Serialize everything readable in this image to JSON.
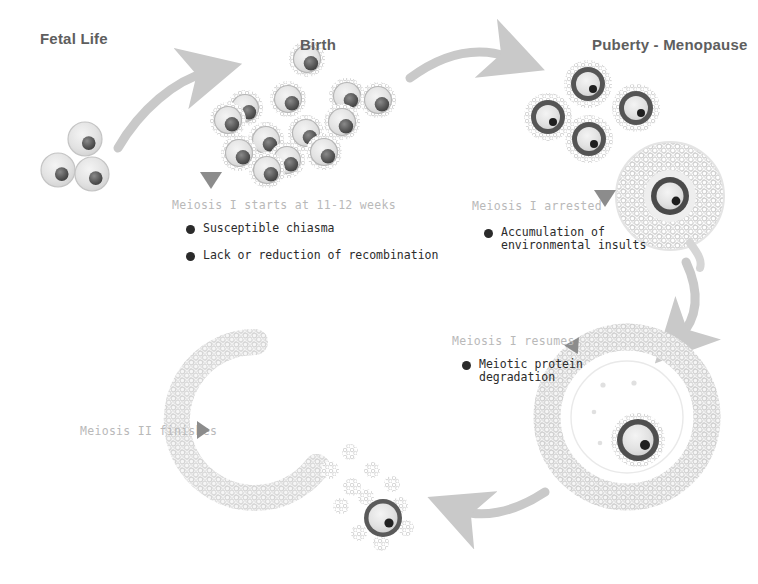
{
  "diagram": {
    "title_visible": false,
    "background": "#ffffff",
    "accent_gray": "#b9b9b9",
    "text_dark": "#2b2b2b",
    "heading_color": "#5e5e5e",
    "arrow_color": "#c9c9c9",
    "marker_color": "#8c8c8c"
  },
  "stages": [
    {
      "id": "fetal-life",
      "label": "Fetal Life",
      "x": 40,
      "y": 30
    },
    {
      "id": "birth",
      "label": "Birth",
      "x": 300,
      "y": 36
    },
    {
      "id": "puberty-menopause",
      "label": "Puberty - Menopause",
      "x": 592,
      "y": 36
    }
  ],
  "phases": [
    {
      "id": "meiosis-i-starts",
      "label": "Meiosis I starts at 11-12 weeks",
      "x": 172,
      "y": 198,
      "marker": "triangle-down",
      "marker_x": 200,
      "marker_y": 172,
      "bullets": [
        {
          "text": "Susceptible chiasma",
          "x": 186,
          "y": 222
        },
        {
          "text": "Lack or reduction of recombination",
          "x": 186,
          "y": 249
        }
      ]
    },
    {
      "id": "meiosis-i-arrested",
      "label": "Meiosis I arrested",
      "x": 472,
      "y": 199,
      "marker": "triangle-down",
      "marker_x": 594,
      "marker_y": 190,
      "bullets": [
        {
          "text": "Accumulation of\nenvironmental insults",
          "x": 484,
          "y": 226
        }
      ]
    },
    {
      "id": "meiosis-i-resumes",
      "label": "Meiosis I resumes",
      "x": 452,
      "y": 334,
      "marker": "triangle-up-right",
      "marker_x": 567,
      "marker_y": 336,
      "bullets": [
        {
          "text": "Meiotic protein\ndegradation",
          "x": 462,
          "y": 358
        }
      ]
    },
    {
      "id": "meiosis-ii-finishes",
      "label": "Meiosis II finishes",
      "x": 80,
      "y": 424,
      "marker": "triangle-right",
      "marker_x": 197,
      "marker_y": 421,
      "bullets": []
    }
  ],
  "cell_groups": [
    {
      "id": "primordial-follicles-fetal",
      "kind": "primordial",
      "cells": [
        {
          "cx": 58,
          "cy": 170,
          "r": 17
        },
        {
          "cx": 85,
          "cy": 139,
          "r": 17
        },
        {
          "cx": 92,
          "cy": 174,
          "r": 17
        }
      ]
    },
    {
      "id": "primordial-follicles-birth",
      "kind": "primordial-spiky",
      "cells": [
        {
          "cx": 307,
          "cy": 59,
          "r": 18
        },
        {
          "cx": 288,
          "cy": 99,
          "r": 18
        },
        {
          "cx": 245,
          "cy": 108,
          "r": 18
        },
        {
          "cx": 347,
          "cy": 96,
          "r": 18
        },
        {
          "cx": 378,
          "cy": 100,
          "r": 18
        },
        {
          "cx": 228,
          "cy": 120,
          "r": 18
        },
        {
          "cx": 266,
          "cy": 140,
          "r": 18
        },
        {
          "cx": 306,
          "cy": 133,
          "r": 18
        },
        {
          "cx": 342,
          "cy": 122,
          "r": 18
        },
        {
          "cx": 239,
          "cy": 153,
          "r": 18
        },
        {
          "cx": 287,
          "cy": 160,
          "r": 18
        },
        {
          "cx": 324,
          "cy": 152,
          "r": 18
        },
        {
          "cx": 267,
          "cy": 170,
          "r": 18
        }
      ]
    },
    {
      "id": "primary-follicles-puberty",
      "kind": "primary",
      "cells": [
        {
          "cx": 588,
          "cy": 84,
          "r": 24
        },
        {
          "cx": 548,
          "cy": 117,
          "r": 24
        },
        {
          "cx": 636,
          "cy": 108,
          "r": 24
        },
        {
          "cx": 589,
          "cy": 139,
          "r": 24
        }
      ]
    }
  ],
  "antral_follicle": {
    "id": "secondary-antral-follicle",
    "cx": 670,
    "cy": 196,
    "r_outer": 54,
    "oocyte_r": 19
  },
  "graafian_follicle": {
    "id": "graafian-follicle",
    "cx": 627,
    "cy": 417,
    "r_outer": 80,
    "r_inner": 55,
    "oocyte_cx": 638,
    "oocyte_cy": 440,
    "oocyte_r": 21
  },
  "ovulated_complex": {
    "id": "ruptured-follicle-cumulus-oocyte",
    "arc_cx": 255,
    "arc_cy": 420,
    "arc_r": 78,
    "oocyte_cx": 383,
    "oocyte_cy": 518,
    "oocyte_r": 19
  },
  "arrows": [
    {
      "id": "arrow-fetal-to-birth",
      "from": "fetal-life",
      "to": "birth",
      "direction": "curve-right-up"
    },
    {
      "id": "arrow-birth-to-puberty",
      "from": "birth",
      "to": "puberty-menopause",
      "direction": "curve-right-up"
    },
    {
      "id": "arrow-puberty-to-graafian",
      "from": "antral-follicle",
      "to": "graafian-follicle",
      "direction": "curve-down"
    },
    {
      "id": "arrow-graafian-to-ovulated",
      "from": "graafian-follicle",
      "to": "ovulated-complex",
      "direction": "curve-left"
    }
  ]
}
